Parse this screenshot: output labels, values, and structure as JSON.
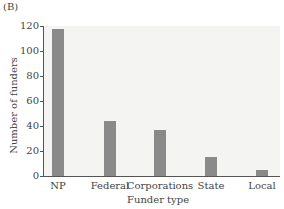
{
  "panel_label": "(B)",
  "chart_data": {
    "type": "bar",
    "title": "",
    "xlabel": "Funder type",
    "ylabel": "Number of funders",
    "categories": [
      "NP",
      "Federal",
      "Corporations",
      "State",
      "Local"
    ],
    "values": [
      118,
      44,
      37,
      15,
      5
    ],
    "ylim": [
      0,
      120
    ],
    "yticks": [
      0,
      20,
      40,
      60,
      80,
      100,
      120
    ],
    "grid": false,
    "legend": null,
    "bar_color": "#8a8a8a"
  }
}
